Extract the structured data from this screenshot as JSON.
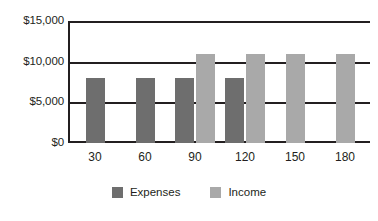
{
  "chart_data": {
    "type": "bar",
    "title": "",
    "subtitle": "",
    "xlabel": "",
    "ylabel": "",
    "categories": [
      "30",
      "60",
      "90",
      "120",
      "150",
      "180"
    ],
    "series": [
      {
        "name": "Expenses",
        "color": "#6e6e6e",
        "values": [
          8000,
          8000,
          8000,
          8000,
          null,
          null
        ]
      },
      {
        "name": "Income",
        "color": "#a9a9a9",
        "values": [
          null,
          null,
          11000,
          11000,
          11000,
          11000
        ]
      }
    ],
    "ylim": [
      0,
      15000
    ],
    "yticks": [
      0,
      5000,
      10000,
      15000
    ],
    "ytick_labels": [
      "$0",
      "$5,000",
      "$10,000",
      "$15,000"
    ],
    "grid": "horizontal",
    "legend_position": "bottom",
    "axis_color": "#231f20",
    "background": "#ffffff"
  },
  "legend": {
    "items": [
      {
        "label": "Expenses",
        "swatch": "expenses-swatch"
      },
      {
        "label": "Income",
        "swatch": "income-swatch"
      }
    ]
  }
}
